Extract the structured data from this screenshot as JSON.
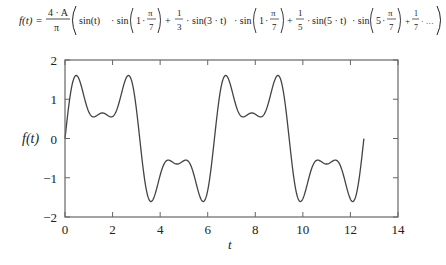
{
  "formula": {
    "lhs": "f(t) =",
    "prefactor_num": "4 · A",
    "prefactor_den": "π",
    "terms": [
      {
        "coef": "",
        "sin_arg": "sin(t)",
        "factor_n": "1",
        "sep": ""
      },
      {
        "coef_num": "1",
        "coef_den": "3",
        "sin_arg": "sin(3 · t)",
        "factor_n": "1",
        "sep": "+"
      },
      {
        "coef_num": "1",
        "coef_den": "5",
        "sin_arg": "sin(5 · t)",
        "factor_n": "5",
        "sep": "+"
      },
      {
        "coef_num": "1",
        "coef_den": "7",
        "sin_arg": "sin(7 · t)",
        "factor_n": "7",
        "sep": "+"
      }
    ],
    "pi_num": "π",
    "pi_den": "7"
  },
  "chart_data": {
    "type": "line",
    "title": "",
    "xlabel": "t",
    "ylabel": "f(t)",
    "xlim": [
      0,
      14
    ],
    "ylim": [
      -2,
      2
    ],
    "xticks": [
      "0",
      "2",
      "4",
      "6",
      "8",
      "10",
      "12",
      "14"
    ],
    "yticks": [
      "2",
      "1",
      "0",
      "−1",
      "−2"
    ],
    "grid": false,
    "legend": "none",
    "series": [
      {
        "name": "f(t)",
        "x_range": [
          0,
          12.566
        ],
        "model": "1.106·sin(t) + 0.842·sin(3t) + 0.386·sin(5t)",
        "key_points": [
          {
            "t": 0,
            "y": 0
          },
          {
            "t": 0.5,
            "y": 1.6
          },
          {
            "t": 1.2,
            "y": 0.55
          },
          {
            "t": 1.57,
            "y": 0.65
          },
          {
            "t": 1.95,
            "y": 0.55
          },
          {
            "t": 2.65,
            "y": 1.6
          },
          {
            "t": 3.14,
            "y": 0
          },
          {
            "t": 3.64,
            "y": -1.6
          },
          {
            "t": 4.71,
            "y": -0.65
          },
          {
            "t": 5.79,
            "y": -1.6
          },
          {
            "t": 6.28,
            "y": 0
          },
          {
            "t": 6.78,
            "y": 1.6
          },
          {
            "t": 7.85,
            "y": 0.65
          },
          {
            "t": 8.93,
            "y": 1.6
          },
          {
            "t": 9.42,
            "y": 0
          },
          {
            "t": 9.92,
            "y": -1.6
          },
          {
            "t": 11.0,
            "y": -0.65
          },
          {
            "t": 12.07,
            "y": -1.6
          },
          {
            "t": 12.566,
            "y": 0
          }
        ],
        "color": "#444444"
      }
    ]
  }
}
